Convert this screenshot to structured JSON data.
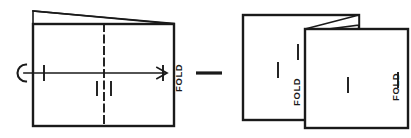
{
  "figure": {
    "stroke_color": "#1a1a1a",
    "background_color": "#ffffff"
  },
  "left_panel": {
    "name": "flat-sheet",
    "fold_label": "FOLD",
    "fold_label_rotation": "-90",
    "center_line_style": "dash-dot",
    "arrow": {
      "name": "fold-direction-arrow",
      "direction": "left-to-right",
      "start_cap": "c-hook",
      "end_cap": "arrowhead"
    },
    "sheet_rect": {
      "x": 33,
      "y": 24,
      "width": 141,
      "height": 102
    },
    "top_wedge": {
      "left_x": 33,
      "right_x": 174,
      "peak_y": 11,
      "base_y": 24
    },
    "center_x": 104,
    "tick_marks": [
      {
        "name": "left-edge-tick",
        "x": 44,
        "y": 73
      },
      {
        "name": "right-edge-tick",
        "x": 163,
        "y": 73
      },
      {
        "name": "lower-left-tick",
        "x": 97,
        "y": 89
      },
      {
        "name": "lower-right-tick",
        "x": 111,
        "y": 89
      }
    ]
  },
  "connector": {
    "name": "step-connector-dash",
    "x1": 196,
    "y1": 73,
    "x2": 222,
    "y2": 73
  },
  "right_panel": {
    "name": "folded-sheet",
    "fold_label_inner": "FOLD",
    "fold_label_outer": "FOLD",
    "fold_label_rotation": "-90",
    "back_rect": {
      "x": 243,
      "y": 15,
      "width": 116,
      "height": 105
    },
    "front_rect": {
      "x": 305,
      "y": 29,
      "width": 103,
      "height": 99
    },
    "wedge": {
      "left_x": 305,
      "right_x": 359,
      "top_y": 15,
      "base_y": 29
    },
    "tick_marks": [
      {
        "name": "back-panel-tick",
        "x": 278,
        "y": 70
      },
      {
        "name": "fold-edge-tick",
        "x": 298,
        "y": 52
      },
      {
        "name": "front-panel-tick",
        "x": 348,
        "y": 85
      },
      {
        "name": "outer-edge-tick",
        "x": 398,
        "y": 80
      }
    ]
  }
}
